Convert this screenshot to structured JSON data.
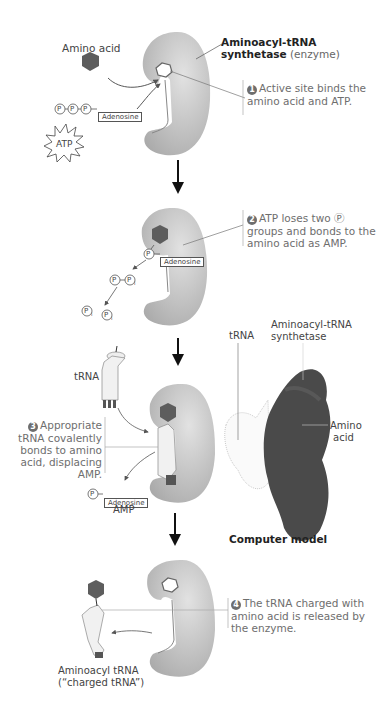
{
  "figure": {
    "title_bold": "Aminoacyl-tRNA synthetase",
    "title_light": "(enzyme)",
    "labels": {
      "amino_acid": "Amino acid",
      "atp": "ATP",
      "adenosine": "Adenosine",
      "p": "P",
      "pi_sub": "i",
      "trna": "tRNA",
      "amp": "AMP",
      "aminoacyl_trna": "Aminoacyl tRNA",
      "charged_trna": "(“charged tRNA”)"
    },
    "steps": [
      {
        "num": "1",
        "text": "Active site binds the amino acid and ATP."
      },
      {
        "num": "2",
        "text": "ATP loses two Ⓟ groups and bonds to the amino acid as AMP."
      },
      {
        "num": "3",
        "text": "Appropriate tRNA covalently bonds to amino acid, displacing AMP."
      },
      {
        "num": "4",
        "text": "The tRNA charged with amino acid is released by the enzyme."
      }
    ],
    "model": {
      "trna": "tRNA",
      "synthetase_line1": "Aminoacyl-tRNA",
      "synthetase_line2": "synthetase",
      "amino_line1": "Amino",
      "amino_line2": "acid",
      "caption": "Computer model"
    }
  },
  "colors": {
    "enzyme": "#c4c4c4",
    "amino_acid": "#5d5d5d",
    "model_dark": "#4a4a4a",
    "step_text": "#6e6e6e"
  }
}
